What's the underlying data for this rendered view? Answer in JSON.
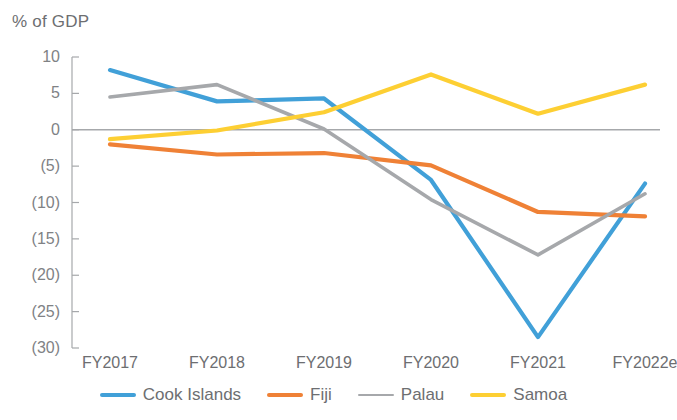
{
  "chart_data": {
    "type": "line",
    "title": "% of GDP",
    "xlabel": "",
    "ylabel": "% of GDP",
    "categories": [
      "FY2017",
      "FY2018",
      "FY2019",
      "FY2020",
      "FY2021",
      "FY2022e"
    ],
    "ylim": [
      -30,
      10
    ],
    "yticks": [
      10,
      5,
      0,
      -5,
      -10,
      -15,
      -20,
      -25,
      -30
    ],
    "ytick_labels": [
      "10",
      "5",
      "0",
      "(5)",
      "(10)",
      "(15)",
      "(20)",
      "(25)",
      "(30)"
    ],
    "grid": false,
    "zero_line": true,
    "legend_position": "bottom",
    "series": [
      {
        "name": "Cook Islands",
        "color": "#41a0d8",
        "values": [
          8.2,
          3.9,
          4.3,
          -6.9,
          -28.5,
          -7.4
        ]
      },
      {
        "name": "Fiji",
        "color": "#ef8136",
        "values": [
          -2.0,
          -3.4,
          -3.2,
          -4.9,
          -11.3,
          -11.9
        ]
      },
      {
        "name": "Palau",
        "color": "#a6a8ab",
        "values": [
          4.5,
          6.2,
          0.1,
          -9.6,
          -17.2,
          -8.8
        ]
      },
      {
        "name": "Samoa",
        "color": "#fdcf33",
        "values": [
          -1.3,
          -0.1,
          2.4,
          7.6,
          2.2,
          6.2
        ]
      }
    ]
  },
  "legend": {
    "items": [
      {
        "label": "Cook Islands",
        "color": "#41a0d8",
        "style": "solid"
      },
      {
        "label": "Fiji",
        "color": "#ef8136",
        "style": "solid"
      },
      {
        "label": "Palau",
        "color": "#a6a8ab",
        "style": "thin"
      },
      {
        "label": "Samoa",
        "color": "#fdcf33",
        "style": "solid"
      }
    ]
  },
  "axis": {
    "title": "% of GDP",
    "zero_line_color": "#a6a8ab",
    "axis_line_color": "#a6a8ab"
  }
}
